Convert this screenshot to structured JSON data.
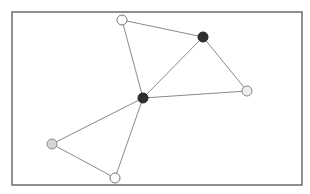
{
  "diagram": {
    "type": "graph",
    "frame": {
      "x": 12,
      "y": 12,
      "width": 290,
      "height": 173,
      "stroke": "#6b6b6b"
    },
    "edge_color": "#8a8a8a",
    "nodes": [
      {
        "id": "n1",
        "x": 122,
        "y": 20,
        "r": 5,
        "fill": "#ffffff",
        "stroke": "#777777",
        "label": "top node"
      },
      {
        "id": "n2",
        "x": 203,
        "y": 37,
        "r": 5,
        "fill": "#2e2e2e",
        "stroke": "#222222",
        "label": "upper-right hub"
      },
      {
        "id": "n3",
        "x": 247,
        "y": 91,
        "r": 5,
        "fill": "#eeeeee",
        "stroke": "#888888",
        "label": "right node"
      },
      {
        "id": "n4",
        "x": 143,
        "y": 98,
        "r": 5,
        "fill": "#2e2e2e",
        "stroke": "#222222",
        "label": "center hub"
      },
      {
        "id": "n5",
        "x": 52,
        "y": 144,
        "r": 5,
        "fill": "#d6d6d6",
        "stroke": "#888888",
        "label": "left node"
      },
      {
        "id": "n6",
        "x": 115,
        "y": 178,
        "r": 5,
        "fill": "#ffffff",
        "stroke": "#777777",
        "label": "bottom node"
      }
    ],
    "edges": [
      {
        "from": "n1",
        "to": "n2"
      },
      {
        "from": "n1",
        "to": "n4"
      },
      {
        "from": "n2",
        "to": "n4"
      },
      {
        "from": "n2",
        "to": "n3"
      },
      {
        "from": "n4",
        "to": "n3"
      },
      {
        "from": "n4",
        "to": "n5"
      },
      {
        "from": "n4",
        "to": "n6"
      },
      {
        "from": "n5",
        "to": "n6"
      }
    ]
  }
}
